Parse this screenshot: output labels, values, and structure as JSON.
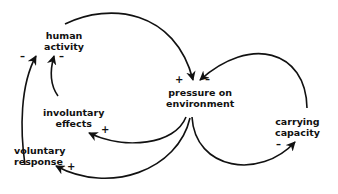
{
  "nodes": {
    "human_activity": {
      "line1": "human",
      "line2": "activity"
    },
    "pressure": {
      "line1": "pressure on",
      "line2": "environment"
    },
    "involuntary": {
      "line1": "involuntary",
      "line2": "effects"
    },
    "voluntary": {
      "line1": "voluntary",
      "line2": "response"
    },
    "carrying": {
      "line1": "carrying",
      "line2": "capacity"
    }
  },
  "signs": {
    "ha_left": "–",
    "ha_right": "–",
    "pressure_plus": "+",
    "pressure_minus": "–",
    "involuntary_plus": "+",
    "voluntary_plus": "+",
    "carrying_minus": "–"
  },
  "edges": [
    {
      "from": "human activity",
      "to": "pressure on environment",
      "polarity": "+"
    },
    {
      "from": "pressure on environment",
      "to": "involuntary effects",
      "polarity": "+"
    },
    {
      "from": "pressure on environment",
      "to": "voluntary response",
      "polarity": "+"
    },
    {
      "from": "involuntary effects",
      "to": "human activity",
      "polarity": "-"
    },
    {
      "from": "voluntary response",
      "to": "human activity",
      "polarity": "-"
    },
    {
      "from": "pressure on environment",
      "to": "carrying capacity",
      "polarity": "-"
    },
    {
      "from": "carrying capacity",
      "to": "pressure on environment",
      "polarity": "-"
    }
  ]
}
